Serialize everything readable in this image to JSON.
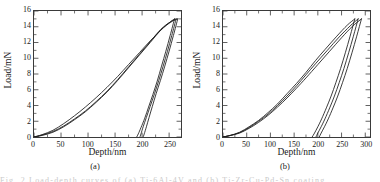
{
  "figure": {
    "panels": [
      {
        "caption": "(a)",
        "axes": {
          "xlabel": "Depth/nm",
          "ylabel": "Load/mN",
          "xticks": [
            0,
            50,
            100,
            150,
            200,
            250
          ],
          "yticks": [
            0,
            2,
            4,
            6,
            8,
            10,
            12,
            14,
            16
          ],
          "xlim": [
            0,
            272
          ],
          "ylim": [
            0,
            16
          ]
        }
      },
      {
        "caption": "(b)",
        "axes": {
          "xlabel": "Depth/nm",
          "ylabel": "Load/mN",
          "xticks": [
            0,
            50,
            100,
            150,
            200,
            250,
            300
          ],
          "yticks": [
            0,
            2,
            4,
            6,
            8,
            10,
            12,
            14,
            16
          ],
          "xlim": [
            0,
            310
          ],
          "ylim": [
            0,
            16
          ]
        }
      }
    ],
    "bleed_caption": "Fig. 2  Load-depth curves of (a) Ti-6Al-4V and (b) Ti-Zr-Cu-Pd-Sn coating"
  },
  "chart_data": [
    {
      "type": "line",
      "title": "",
      "subtitle": "(a)",
      "xlabel": "Depth/nm",
      "ylabel": "Load/mN",
      "xlim": [
        0,
        272
      ],
      "ylim": [
        0,
        16
      ],
      "xticks": [
        0,
        50,
        100,
        150,
        200,
        250
      ],
      "yticks": [
        0,
        2,
        4,
        6,
        8,
        10,
        12,
        14,
        16
      ],
      "grid": false,
      "legend": "none",
      "line_color": "#1a1a1a",
      "description": "Three overlapping nanoindentation load-unload hysteresis loops; peak load 15 mN at maximum depth ~260-266 nm; residual depths ~190-215 nm.",
      "series": [
        {
          "name": "indent-1-loading",
          "x": [
            0,
            15,
            35,
            55,
            75,
            95,
            115,
            135,
            155,
            175,
            195,
            215,
            235,
            250,
            260
          ],
          "y": [
            0,
            0.2,
            0.6,
            1.3,
            2.2,
            3.2,
            4.4,
            5.7,
            7.2,
            8.8,
            10.4,
            12.0,
            13.6,
            14.5,
            15.0
          ]
        },
        {
          "name": "indent-1-unloading",
          "x": [
            260,
            252,
            244,
            236,
            228,
            220,
            212,
            205,
            198,
            193,
            190
          ],
          "y": [
            15.0,
            12.9,
            10.9,
            9.0,
            7.1,
            5.4,
            3.8,
            2.4,
            1.2,
            0.4,
            0.0
          ]
        },
        {
          "name": "indent-2-loading",
          "x": [
            0,
            15,
            35,
            55,
            75,
            95,
            115,
            135,
            155,
            175,
            195,
            215,
            235,
            252,
            263
          ],
          "y": [
            0,
            0.25,
            0.7,
            1.4,
            2.3,
            3.3,
            4.5,
            5.8,
            7.3,
            8.9,
            10.5,
            12.1,
            13.7,
            14.6,
            15.0
          ]
        },
        {
          "name": "indent-2-unloading",
          "x": [
            263,
            255,
            247,
            239,
            231,
            223,
            215,
            208,
            202,
            198,
            196
          ],
          "y": [
            15.0,
            12.9,
            10.9,
            9.0,
            7.2,
            5.5,
            3.9,
            2.5,
            1.3,
            0.4,
            0.0
          ]
        },
        {
          "name": "indent-3-loading",
          "x": [
            0,
            15,
            35,
            55,
            75,
            95,
            115,
            135,
            155,
            175,
            195,
            215,
            240,
            256,
            266
          ],
          "y": [
            0,
            0.3,
            0.85,
            1.7,
            2.7,
            3.8,
            5.0,
            6.3,
            7.7,
            9.2,
            10.7,
            12.2,
            13.9,
            14.7,
            15.0
          ]
        },
        {
          "name": "indent-3-unloading",
          "x": [
            266,
            258,
            250,
            242,
            234,
            226,
            219,
            213,
            208,
            204,
            202
          ],
          "y": [
            15.0,
            12.9,
            10.9,
            9.0,
            7.2,
            5.5,
            3.9,
            2.5,
            1.3,
            0.4,
            0.0
          ]
        }
      ]
    },
    {
      "type": "line",
      "title": "",
      "subtitle": "(b)",
      "xlabel": "Depth/nm",
      "ylabel": "Load/mN",
      "xlim": [
        0,
        310
      ],
      "ylim": [
        0,
        16
      ],
      "xticks": [
        0,
        50,
        100,
        150,
        200,
        250,
        300
      ],
      "yticks": [
        0,
        2,
        4,
        6,
        8,
        10,
        12,
        14,
        16
      ],
      "grid": false,
      "legend": "none",
      "line_color": "#1a1a1a",
      "description": "Three overlapping nanoindentation load-unload hysteresis loops; peak load 15 mN at maximum depth ~278-292 nm; residual depths ~188-210 nm.",
      "series": [
        {
          "name": "indent-1-loading",
          "x": [
            0,
            15,
            35,
            55,
            75,
            95,
            115,
            135,
            155,
            175,
            195,
            215,
            240,
            262,
            278
          ],
          "y": [
            0,
            0.2,
            0.6,
            1.3,
            2.1,
            3.1,
            4.2,
            5.5,
            6.8,
            8.2,
            9.7,
            11.1,
            12.8,
            14.2,
            15.0
          ]
        },
        {
          "name": "indent-1-unloading",
          "x": [
            278,
            268,
            258,
            248,
            238,
            228,
            218,
            208,
            200,
            193,
            188
          ],
          "y": [
            15.0,
            12.8,
            10.7,
            8.7,
            6.9,
            5.2,
            3.7,
            2.3,
            1.3,
            0.5,
            0.0
          ]
        },
        {
          "name": "indent-2-loading",
          "x": [
            0,
            15,
            35,
            55,
            75,
            95,
            115,
            135,
            155,
            175,
            195,
            220,
            245,
            268,
            285
          ],
          "y": [
            0,
            0.2,
            0.55,
            1.2,
            2.0,
            2.9,
            4.0,
            5.2,
            6.5,
            7.9,
            9.3,
            11.0,
            12.7,
            14.1,
            15.0
          ]
        },
        {
          "name": "indent-2-unloading",
          "x": [
            285,
            275,
            265,
            255,
            245,
            235,
            225,
            215,
            207,
            200,
            196
          ],
          "y": [
            15.0,
            12.8,
            10.7,
            8.7,
            6.9,
            5.2,
            3.7,
            2.3,
            1.3,
            0.5,
            0.0
          ]
        },
        {
          "name": "indent-3-loading",
          "x": [
            0,
            15,
            35,
            55,
            75,
            95,
            115,
            135,
            155,
            175,
            200,
            225,
            250,
            272,
            292
          ],
          "y": [
            0,
            0.18,
            0.5,
            1.1,
            1.85,
            2.75,
            3.8,
            4.95,
            6.2,
            7.5,
            9.2,
            10.9,
            12.6,
            14.0,
            15.0
          ]
        },
        {
          "name": "indent-3-unloading",
          "x": [
            292,
            282,
            272,
            262,
            252,
            242,
            232,
            222,
            214,
            207,
            203
          ],
          "y": [
            15.0,
            12.8,
            10.7,
            8.7,
            6.9,
            5.2,
            3.7,
            2.3,
            1.3,
            0.5,
            0.0
          ]
        }
      ]
    }
  ]
}
